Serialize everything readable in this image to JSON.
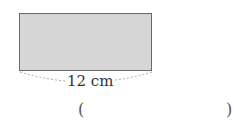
{
  "figure": {
    "shape": "rectangle",
    "fill_color": "#d6d6d6",
    "border_color": "#6a6a6a",
    "width_label": "12 cm"
  },
  "answer": {
    "open_paren": "(",
    "close_paren": ")",
    "value": ""
  }
}
